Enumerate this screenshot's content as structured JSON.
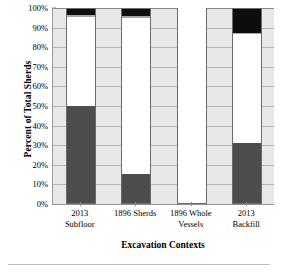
{
  "chart_data": {
    "type": "bar",
    "subtype": "stacked-100-percent",
    "title": "",
    "xlabel": "Excavation Contexts",
    "ylabel": "Percent of Total Sherds",
    "categories": [
      "2013 Subfloor",
      "1896 Sherds",
      "1896 Whole Vessels",
      "2013 Backfill"
    ],
    "category_lines": [
      [
        "2013",
        "Subfloor"
      ],
      [
        "1896 Sherds"
      ],
      [
        "1896 Whole",
        "Vessels"
      ],
      [
        "2013",
        "Backfill"
      ]
    ],
    "ylim": [
      0,
      100
    ],
    "ytick_values": [
      0,
      10,
      20,
      30,
      40,
      50,
      60,
      70,
      80,
      90,
      100
    ],
    "ytick_labels": [
      "0%",
      "10%",
      "20%",
      "30%",
      "40%",
      "50%",
      "60%",
      "70%",
      "80%",
      "90%",
      "100%"
    ],
    "grid": true,
    "grid_axis": "y",
    "legend": "none",
    "legend_position": "none",
    "series": [
      {
        "name": "Series 1",
        "color": "#4d4d4d",
        "values": [
          50.0,
          15.5,
          0.5,
          31.0
        ]
      },
      {
        "name": "Series 2",
        "color": "#ffffff",
        "values": [
          45.5,
          79.5,
          99.5,
          55.5
        ]
      },
      {
        "name": "Series 3",
        "color": "#a6a6a6",
        "values": [
          1.0,
          1.0,
          0.0,
          1.0
        ]
      },
      {
        "name": "Series 4",
        "color": "#0d0d0d",
        "values": [
          3.5,
          4.0,
          0.0,
          12.5
        ]
      }
    ],
    "plot_background": "#e8e8e8",
    "gridline_color": "#b4b4b4",
    "axis_color": "#8f8f8f",
    "bar_outline_color": "#6b6b6b"
  }
}
